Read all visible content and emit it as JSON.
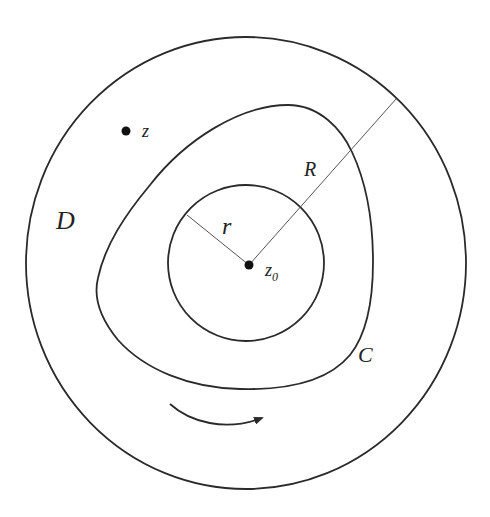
{
  "diagram": {
    "type": "complex-analysis-contour",
    "colors": {
      "background": "#ffffff",
      "stroke": "#2a2a2a",
      "thin_stroke": "#555555",
      "text": "#222222"
    },
    "outer_circle": {
      "label": "D",
      "cx": 246,
      "cy": 263,
      "rx": 220,
      "ry": 226
    },
    "inner_circle": {
      "cx": 246,
      "cy": 263,
      "r": 78
    },
    "center_point": {
      "label": "z",
      "subscript": "0",
      "x": 249,
      "y": 265
    },
    "point_z": {
      "label": "z",
      "x": 126,
      "y": 131
    },
    "contour": {
      "label": "C"
    },
    "radius_small": {
      "label": "r"
    },
    "radius_large": {
      "label": "R"
    },
    "orientation_arrow": {
      "direction": "counterclockwise-bottom-left-to-right"
    }
  }
}
